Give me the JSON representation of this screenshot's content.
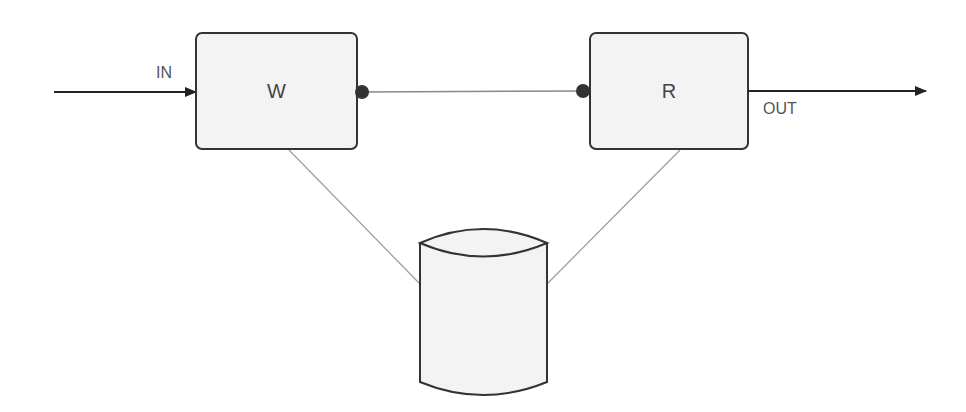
{
  "diagram": {
    "type": "block-diagram",
    "nodes": [
      {
        "id": "w",
        "label": "W",
        "shape": "rounded-rectangle"
      },
      {
        "id": "r",
        "label": "R",
        "shape": "rounded-rectangle"
      },
      {
        "id": "storage",
        "label": "",
        "shape": "cylinder"
      }
    ],
    "edges": [
      {
        "from": "input",
        "to": "w",
        "label": "IN",
        "style": "arrow"
      },
      {
        "from": "w",
        "to": "r",
        "label": "",
        "style": "dot-connectors"
      },
      {
        "from": "r",
        "to": "output",
        "label": "OUT",
        "style": "arrow"
      },
      {
        "from": "w",
        "to": "storage",
        "label": "",
        "style": "thin-gray-line"
      },
      {
        "from": "r",
        "to": "storage",
        "label": "",
        "style": "thin-gray-line"
      }
    ],
    "colors": {
      "box_fill": "#f3f3f3",
      "stroke": "#333333",
      "link_gray": "#a0a0a0",
      "text": "#555555"
    }
  },
  "labels": {
    "in": "IN",
    "out": "OUT",
    "w_box": "W",
    "r_box": "R"
  }
}
